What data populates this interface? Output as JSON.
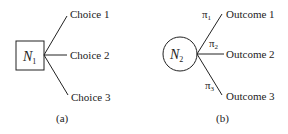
{
  "panel_a": {
    "node_label": "N",
    "node_subscript": "1",
    "node_shape": "square",
    "branches": [
      "Choice 1",
      "Choice 2",
      "Choice 3"
    ],
    "caption": "(a)"
  },
  "panel_b": {
    "node_label": "N",
    "node_subscript": "2",
    "node_shape": "circle",
    "branches": [
      "Outcome 1",
      "Outcome 2",
      "Outcome 3"
    ],
    "probabilities": [
      {
        "symbol": "π",
        "subscript": "1"
      },
      {
        "symbol": "π",
        "subscript": "2"
      },
      {
        "symbol": "π",
        "subscript": "3"
      }
    ],
    "caption": "(b)"
  }
}
